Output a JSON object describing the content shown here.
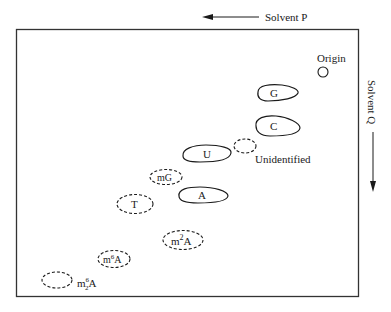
{
  "diagram": {
    "type": "2D paper chromatogram",
    "solvent_p": {
      "label": "Solvent P",
      "direction": "left"
    },
    "solvent_q": {
      "label": "Solvent Q",
      "direction": "down"
    },
    "origin": {
      "label": "Origin"
    },
    "spots": [
      {
        "id": "G",
        "label": "G",
        "style": "solid"
      },
      {
        "id": "C",
        "label": "C",
        "style": "solid"
      },
      {
        "id": "U",
        "label": "U",
        "style": "solid"
      },
      {
        "id": "unidentified",
        "label": "Unidentified",
        "style": "dashed"
      },
      {
        "id": "mG",
        "label": "mG",
        "style": "dashed"
      },
      {
        "id": "A",
        "label": "A",
        "style": "solid"
      },
      {
        "id": "T",
        "label": "T",
        "style": "dashed"
      },
      {
        "id": "m2A",
        "label_base": "m",
        "label_sup": "2",
        "label_tail": "A",
        "style": "dashed"
      },
      {
        "id": "m6A",
        "label_base": "m",
        "label_sup": "6",
        "label_tail": "A",
        "style": "dashed"
      },
      {
        "id": "m62A",
        "label_base": "m",
        "label_sup": "6",
        "label_sub": "2",
        "label_tail": "A",
        "style": "dashed"
      }
    ]
  }
}
